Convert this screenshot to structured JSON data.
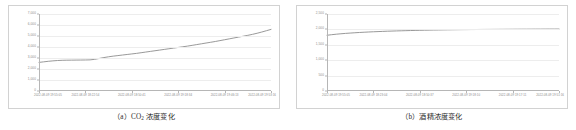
{
  "figure": {
    "panels": [
      {
        "key": "co2",
        "caption_prefix": "（a）CO",
        "caption_sub": "2",
        "caption_suffix": " 浓度变化"
      },
      {
        "key": "alcohol",
        "caption_prefix": "（b）酒精浓度变化",
        "caption_sub": "",
        "caption_suffix": ""
      }
    ]
  },
  "chart_data": [
    {
      "type": "line",
      "key": "co2",
      "title": "（a）CO2 浓度变化",
      "xlabel": "",
      "ylabel": "",
      "grid": true,
      "legend": false,
      "line_color": "#8d8d8d",
      "ylim": [
        0,
        7000
      ],
      "yticks": [
        0,
        1000,
        2000,
        3000,
        4000,
        5000,
        6000,
        7000
      ],
      "ytick_labels": [
        "0",
        "1,000",
        "2,000",
        "3,000",
        "4,000",
        "5,000",
        "6,000",
        "7,000"
      ],
      "xtick_labels": [
        "2022-08-09 19:55:05",
        "2022-08-09 18:22:54",
        "2022-08-09 18:50:41",
        "2022-08-09 19:18:34",
        "2022-08-09 19:46:13",
        "2022-08-09 19:53:16"
      ],
      "x": [
        0,
        2,
        4,
        6,
        8,
        10,
        12,
        14,
        16,
        18,
        20,
        22,
        24,
        26,
        28,
        30,
        32,
        34,
        36,
        38,
        40,
        42,
        44,
        46,
        48,
        50,
        52,
        54,
        56,
        58,
        60,
        62,
        64,
        66,
        68,
        70,
        72,
        74,
        76,
        78,
        80,
        82,
        84,
        86,
        88,
        90,
        92,
        94,
        96,
        98,
        100
      ],
      "values": [
        2600,
        2650,
        2700,
        2740,
        2770,
        2790,
        2800,
        2805,
        2810,
        2815,
        2820,
        2830,
        2880,
        2960,
        3040,
        3110,
        3170,
        3220,
        3270,
        3320,
        3370,
        3420,
        3480,
        3540,
        3600,
        3660,
        3720,
        3780,
        3840,
        3900,
        3960,
        4020,
        4080,
        4150,
        4220,
        4290,
        4360,
        4430,
        4500,
        4580,
        4660,
        4740,
        4820,
        4900,
        4980,
        5060,
        5150,
        5250,
        5360,
        5480,
        5600
      ]
    },
    {
      "type": "line",
      "key": "alcohol",
      "title": "（b）酒精浓度变化",
      "xlabel": "",
      "ylabel": "",
      "grid": true,
      "legend": false,
      "line_color": "#8d8d8d",
      "ylim": [
        0,
        2500
      ],
      "yticks": [
        0,
        500,
        1000,
        1500,
        2000,
        2500
      ],
      "ytick_labels": [
        "0",
        "500",
        "1,000",
        "1,500",
        "2,000",
        "2,500"
      ],
      "xtick_labels": [
        "2022-08-09 19:55:05",
        "2022-08-09 18:23:04",
        "2022-08-09 18:50:37",
        "2022-08-09 19:18:10",
        "2022-08-09 19:17:11",
        "2022-08-09 19:51:16"
      ],
      "x": [
        0,
        2,
        4,
        6,
        8,
        10,
        12,
        14,
        16,
        18,
        20,
        22,
        24,
        26,
        28,
        30,
        32,
        34,
        36,
        38,
        40,
        42,
        44,
        46,
        48,
        50,
        52,
        54,
        56,
        58,
        60,
        62,
        64,
        66,
        68,
        70,
        72,
        74,
        76,
        78,
        80,
        82,
        84,
        86,
        88,
        90,
        92,
        94,
        96,
        98,
        100
      ],
      "values": [
        1810,
        1828,
        1844,
        1858,
        1870,
        1881,
        1891,
        1900,
        1908,
        1916,
        1923,
        1929,
        1935,
        1941,
        1946,
        1951,
        1955,
        1959,
        1963,
        1967,
        1970,
        1973,
        1976,
        1979,
        1981,
        1984,
        1986,
        1988,
        1990,
        1992,
        1993,
        1995,
        1996,
        1998,
        1999,
        2000,
        2001,
        2002,
        2003,
        2004,
        2005,
        2006,
        2007,
        2007,
        2008,
        2009,
        2009,
        2010,
        2011,
        2011,
        2012
      ]
    }
  ]
}
